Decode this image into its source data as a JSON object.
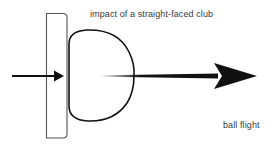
{
  "diagram": {
    "title": "impact of a straight-faced club",
    "ball_flight_label": "ball flight",
    "elements": {
      "club_face": "club-face-rectangle",
      "ball": "compressed-ball-d-shape",
      "swing_arrow": "swing-direction-arrow",
      "flight_arrow": "ball-flight-arrow"
    },
    "colors": {
      "stroke": "#111111",
      "club_stroke": "#555555",
      "text": "#3a3a3a",
      "background": "#ffffff"
    }
  }
}
